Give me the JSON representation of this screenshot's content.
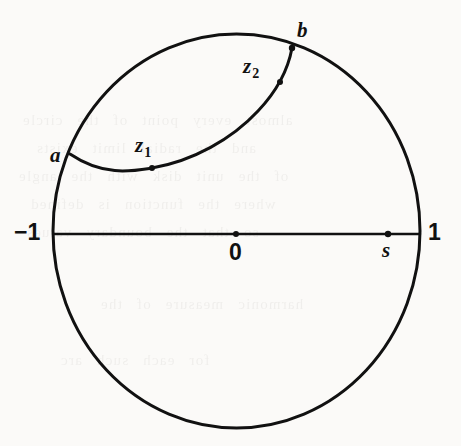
{
  "figure": {
    "background_color": "#fbfaf8",
    "ink_color": "#111111",
    "stroke_width": 3,
    "canvas": {
      "width": 461,
      "height": 446
    }
  },
  "geometry": {
    "disk": {
      "name": "unit-circle",
      "center": {
        "x": 236.5,
        "y": 231
      },
      "radius_x": 183.5,
      "radius_y": 197
    },
    "diameter_line": {
      "name": "real-axis",
      "from": {
        "x": 53,
        "y": 234
      },
      "to": {
        "x": 420,
        "y": 234
      }
    },
    "inner_arc": {
      "name": "geodesic-arc-a-to-b",
      "from": {
        "x": 70,
        "y": 154
      },
      "to": {
        "x": 292,
        "y": 48
      },
      "path": "M 70,154 C 104,177 133,171 152,168 C 193,161 232,139 258,111 C 276,92 288,70 292,48"
    }
  },
  "points": [
    {
      "id": "a",
      "label": "a",
      "style": "italic",
      "x": 70,
      "y": 154,
      "marker": false,
      "label_x": 50,
      "label_y": 145
    },
    {
      "id": "b",
      "label": "b",
      "style": "italic",
      "x": 292,
      "y": 48,
      "marker": true,
      "label_x": 297,
      "label_y": 20
    },
    {
      "id": "z1",
      "label": "z",
      "sub": "1",
      "style": "italic",
      "x": 152,
      "y": 168,
      "marker": true,
      "label_x": 135,
      "label_y": 135
    },
    {
      "id": "z2",
      "label": "z",
      "sub": "2",
      "style": "italic",
      "x": 280,
      "y": 82,
      "marker": true,
      "label_x": 243,
      "label_y": 56
    },
    {
      "id": "minus1",
      "label": "−1",
      "style": "upright",
      "x": 53,
      "y": 234,
      "marker": false,
      "label_x": 14,
      "label_y": 221
    },
    {
      "id": "zero",
      "label": "0",
      "style": "upright",
      "x": 236,
      "y": 234,
      "marker": true,
      "label_x": 229,
      "label_y": 241
    },
    {
      "id": "s",
      "label": "s",
      "style": "italic",
      "x": 388,
      "y": 234,
      "marker": true,
      "label_x": 382,
      "label_y": 240
    },
    {
      "id": "one",
      "label": "1",
      "style": "upright",
      "x": 420,
      "y": 234,
      "marker": false,
      "label_x": 428,
      "label_y": 221
    }
  ],
  "ghost_text": {
    "note": "faint bleed-through from reverse page",
    "lines": [
      {
        "top": 112,
        "left": 22,
        "text": "almost   every  point  of  the  circle"
      },
      {
        "top": 140,
        "left": 36,
        "text": "and  the  radial  limit   exists"
      },
      {
        "top": 168,
        "left": 18,
        "text": "of  the  unit  disk  with  the  angle"
      },
      {
        "top": 196,
        "left": 30,
        "text": "where  the  function  is  defined"
      },
      {
        "top": 224,
        "left": 26,
        "text": "so  that  the  boundary  values"
      },
      {
        "top": 296,
        "left": 100,
        "text": "harmonic   measure   of   the"
      },
      {
        "top": 352,
        "left": 60,
        "text": "for  each  such  arc"
      }
    ]
  }
}
